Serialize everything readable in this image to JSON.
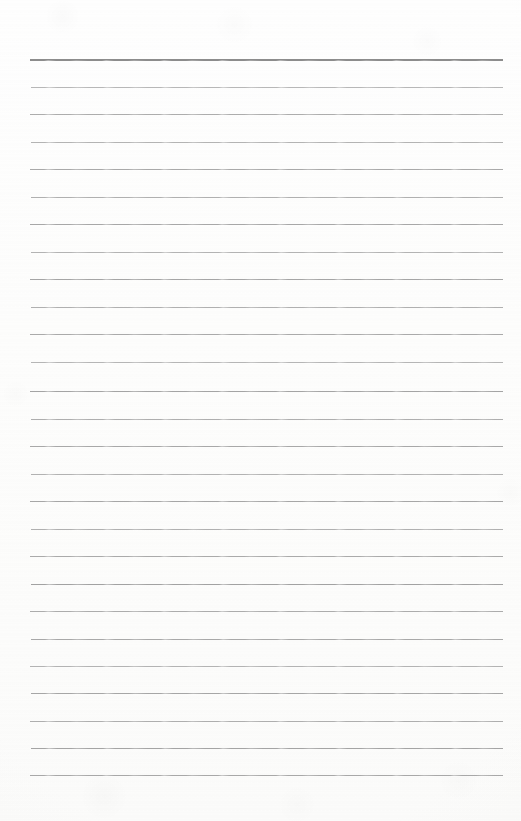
{
  "document": {
    "kind": "ruled-notebook-page",
    "title": "Ruled notebook page",
    "description": "Blank lined paper scan with no written content",
    "page_width": 521,
    "page_height": 821,
    "background_color": "#fdfdfd",
    "content_text": ""
  },
  "ruling": {
    "line_count": 27,
    "first_line_y": 59,
    "line_spacing": 27.54,
    "line_left_x": 30,
    "line_right_x": 503,
    "line_length": 473,
    "default_line_color": "#a6a6a6",
    "default_line_thickness": 1,
    "header_rule_color": "#8c8c8c",
    "header_rule_thickness": 2,
    "header_rule_index": 0,
    "top_margin": 59,
    "bottom_margin": 46,
    "left_margin": 30,
    "right_margin": 18
  },
  "lines": [
    {
      "index": 1,
      "y": 59,
      "left": 30,
      "right": 503,
      "color": "#8c8c8c",
      "thickness": 2,
      "opacity": 1.0,
      "text": ""
    },
    {
      "index": 2,
      "y": 87,
      "left": 31,
      "right": 503,
      "color": "#aeaeae",
      "thickness": 1,
      "opacity": 0.88,
      "text": ""
    },
    {
      "index": 3,
      "y": 114,
      "left": 30,
      "right": 503,
      "color": "#a8a8a8",
      "thickness": 1,
      "opacity": 0.94,
      "text": ""
    },
    {
      "index": 4,
      "y": 142,
      "left": 31,
      "right": 503,
      "color": "#acacac",
      "thickness": 1,
      "opacity": 0.9,
      "text": ""
    },
    {
      "index": 5,
      "y": 169,
      "left": 30,
      "right": 503,
      "color": "#a6a6a6",
      "thickness": 1,
      "opacity": 0.96,
      "text": ""
    },
    {
      "index": 6,
      "y": 197,
      "left": 31,
      "right": 503,
      "color": "#aaaaaa",
      "thickness": 1,
      "opacity": 0.92,
      "text": ""
    },
    {
      "index": 7,
      "y": 224,
      "left": 30,
      "right": 503,
      "color": "#a5a5a5",
      "thickness": 1,
      "opacity": 0.97,
      "text": ""
    },
    {
      "index": 8,
      "y": 252,
      "left": 31,
      "right": 503,
      "color": "#acacac",
      "thickness": 1,
      "opacity": 0.9,
      "text": ""
    },
    {
      "index": 9,
      "y": 279,
      "left": 30,
      "right": 503,
      "color": "#a4a4a4",
      "thickness": 1,
      "opacity": 0.98,
      "text": ""
    },
    {
      "index": 10,
      "y": 307,
      "left": 31,
      "right": 503,
      "color": "#aaaaaa",
      "thickness": 1,
      "opacity": 0.92,
      "text": ""
    },
    {
      "index": 11,
      "y": 334,
      "left": 30,
      "right": 503,
      "color": "#a6a6a6",
      "thickness": 1,
      "opacity": 0.95,
      "text": ""
    },
    {
      "index": 12,
      "y": 362,
      "left": 31,
      "right": 503,
      "color": "#adadad",
      "thickness": 1,
      "opacity": 0.89,
      "text": ""
    },
    {
      "index": 13,
      "y": 391,
      "left": 30,
      "right": 503,
      "color": "#a3a3a3",
      "thickness": 1,
      "opacity": 0.99,
      "text": ""
    },
    {
      "index": 14,
      "y": 419,
      "left": 31,
      "right": 503,
      "color": "#a9a9a9",
      "thickness": 1,
      "opacity": 0.93,
      "text": ""
    },
    {
      "index": 15,
      "y": 446,
      "left": 30,
      "right": 503,
      "color": "#a5a5a5",
      "thickness": 1,
      "opacity": 0.96,
      "text": ""
    },
    {
      "index": 16,
      "y": 474,
      "left": 31,
      "right": 503,
      "color": "#ababab",
      "thickness": 1,
      "opacity": 0.91,
      "text": ""
    },
    {
      "index": 17,
      "y": 501,
      "left": 30,
      "right": 503,
      "color": "#a4a4a4",
      "thickness": 1,
      "opacity": 0.97,
      "text": ""
    },
    {
      "index": 18,
      "y": 529,
      "left": 31,
      "right": 503,
      "color": "#aaaaaa",
      "thickness": 1,
      "opacity": 0.92,
      "text": ""
    },
    {
      "index": 19,
      "y": 556,
      "left": 30,
      "right": 503,
      "color": "#a6a6a6",
      "thickness": 1,
      "opacity": 0.95,
      "text": ""
    },
    {
      "index": 20,
      "y": 584,
      "left": 31,
      "right": 503,
      "color": "#a2a2a2",
      "thickness": 1,
      "opacity": 1.0,
      "text": ""
    },
    {
      "index": 21,
      "y": 611,
      "left": 30,
      "right": 503,
      "color": "#a8a8a8",
      "thickness": 1,
      "opacity": 0.94,
      "text": ""
    },
    {
      "index": 22,
      "y": 639,
      "left": 31,
      "right": 503,
      "color": "#a5a5a5",
      "thickness": 1,
      "opacity": 0.96,
      "text": ""
    },
    {
      "index": 23,
      "y": 666,
      "left": 30,
      "right": 503,
      "color": "#acacac",
      "thickness": 1,
      "opacity": 0.9,
      "text": ""
    },
    {
      "index": 24,
      "y": 693,
      "left": 31,
      "right": 503,
      "color": "#a4a4a4",
      "thickness": 1,
      "opacity": 0.97,
      "text": ""
    },
    {
      "index": 25,
      "y": 721,
      "left": 30,
      "right": 503,
      "color": "#a9a9a9",
      "thickness": 1,
      "opacity": 0.93,
      "text": ""
    },
    {
      "index": 26,
      "y": 748,
      "left": 31,
      "right": 503,
      "color": "#a3a3a3",
      "thickness": 1,
      "opacity": 0.98,
      "text": ""
    },
    {
      "index": 27,
      "y": 775,
      "left": 30,
      "right": 503,
      "color": "#a5a5a5",
      "thickness": 1,
      "opacity": 0.96,
      "text": ""
    }
  ]
}
